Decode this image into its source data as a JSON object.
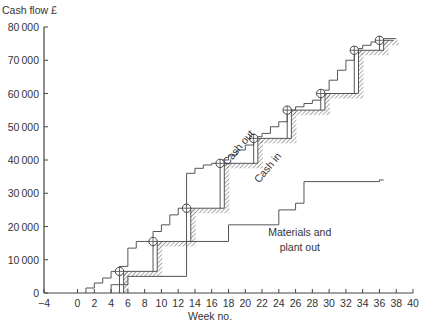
{
  "chart_data": {
    "type": "line",
    "subtype": "stepped-cumulative",
    "title": "",
    "ylabel": "Cash flow £",
    "xlabel": "Week no.",
    "xlim": [
      -4,
      40
    ],
    "ylim": [
      0,
      80000
    ],
    "x_ticks": [
      -4,
      0,
      2,
      4,
      6,
      8,
      10,
      12,
      14,
      16,
      18,
      20,
      22,
      24,
      26,
      28,
      30,
      32,
      34,
      36,
      38,
      40
    ],
    "y_ticks": [
      0,
      10000,
      20000,
      30000,
      40000,
      50000,
      60000,
      70000,
      80000
    ],
    "y_tick_labels": [
      "0",
      "10000",
      "20000",
      "30000",
      "40000",
      "50000",
      "60000",
      "70000",
      "80000"
    ],
    "grid": false,
    "series": [
      {
        "name": "Cash out",
        "x": [
          1,
          2,
          3,
          4,
          5,
          6,
          7,
          8,
          9,
          10,
          11,
          12,
          13,
          14,
          15,
          16,
          17,
          18,
          19,
          20,
          21,
          22,
          23,
          24,
          25,
          26,
          27,
          28,
          29,
          30,
          31,
          32,
          33,
          34,
          35,
          36,
          37
        ],
        "values": [
          1500,
          3000,
          4500,
          6500,
          8000,
          13500,
          15500,
          15500,
          18500,
          20500,
          23500,
          25500,
          36000,
          37500,
          38500,
          39000,
          40000,
          41500,
          43000,
          44500,
          47000,
          48000,
          50000,
          51500,
          55000,
          56000,
          57000,
          58000,
          61000,
          64000,
          67000,
          70000,
          73500,
          74500,
          75500,
          76500,
          76500
        ]
      },
      {
        "name": "Cash in",
        "x": [
          5.5,
          9.5,
          13.5,
          17.5,
          21.5,
          25.5,
          29.5,
          33.5,
          36.5
        ],
        "values": [
          6500,
          15500,
          25500,
          39000,
          46500,
          55000,
          60000,
          73000,
          76000
        ],
        "style": "hatched-step"
      },
      {
        "name": "Materials and plant out",
        "x": [
          4,
          6,
          13,
          18,
          24,
          26,
          27,
          36
        ],
        "values": [
          2500,
          5000,
          15500,
          20500,
          25000,
          27000,
          33500,
          34000
        ]
      }
    ],
    "valuation_points": {
      "x": [
        5,
        9,
        13,
        17,
        21,
        25,
        29,
        33,
        36
      ],
      "values": [
        6500,
        15500,
        25500,
        39000,
        46500,
        55000,
        60000,
        73000,
        76000
      ],
      "marker": "circle-with-cross"
    },
    "annotations": [
      {
        "text": "Cash out",
        "x": 19.5,
        "y": 43000,
        "rotation": -50
      },
      {
        "text": "Cash in",
        "x": 23,
        "y": 37000,
        "rotation": -50
      },
      {
        "text": "Materials and",
        "x": 26.5,
        "y": 17000
      },
      {
        "text": "plant out",
        "x": 26.5,
        "y": 12500
      }
    ],
    "legend": "none (inline labels)"
  }
}
